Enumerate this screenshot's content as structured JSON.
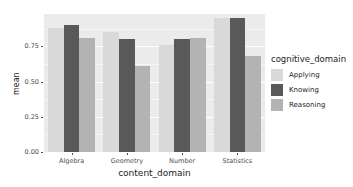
{
  "chart_data": {
    "type": "bar",
    "title": "",
    "xlabel": "content_domain",
    "ylabel": "mean",
    "categories": [
      "Algebra",
      "Geometry",
      "Number",
      "Statistics"
    ],
    "series": [
      {
        "name": "Applying",
        "color": "#D9D9D9",
        "values": [
          0.88,
          0.85,
          0.76,
          0.95
        ]
      },
      {
        "name": "Knowing",
        "color": "#595959",
        "values": [
          0.9,
          0.8,
          0.8,
          0.95
        ]
      },
      {
        "name": "Reasoning",
        "color": "#B3B3B3",
        "values": [
          0.81,
          0.61,
          0.81,
          0.68
        ]
      }
    ],
    "ylim": [
      0,
      0.98
    ],
    "yticks": [
      0.0,
      0.25,
      0.5,
      0.75
    ],
    "ytick_labels": [
      "0.00",
      "0.25",
      "0.50",
      "0.75"
    ],
    "grid": true,
    "legend_position": "right",
    "legend_title": "cognitive_domain",
    "panel_background": "#EBEBEB",
    "grid_color": "#FFFFFF"
  },
  "axes": {
    "y_title": "mean",
    "x_title": "content_domain"
  },
  "legend": {
    "title": "cognitive_domain",
    "entries": [
      {
        "label": "Applying",
        "color": "#D9D9D9"
      },
      {
        "label": "Knowing",
        "color": "#595959"
      },
      {
        "label": "Reasoning",
        "color": "#B3B3B3"
      }
    ]
  }
}
